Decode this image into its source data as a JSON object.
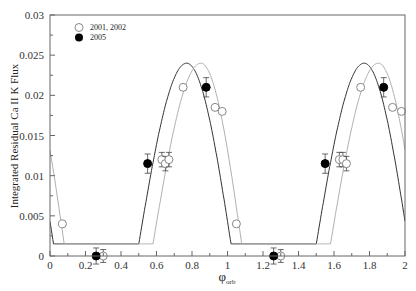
{
  "chart_data": {
    "type": "scatter",
    "title": "",
    "xlabel": "φ_orb",
    "xlabel_main": "φ",
    "xlabel_sub": "orb",
    "ylabel": "Integrated Residual Ca II K Flux",
    "xlim": [
      0,
      2
    ],
    "ylim": [
      0,
      0.03
    ],
    "x_ticks": [
      0,
      0.2,
      0.4,
      0.6,
      0.8,
      1,
      1.2,
      1.4,
      1.6,
      1.8,
      2
    ],
    "x_tick_labels": [
      "0",
      "0.2",
      "0.4",
      "0.6",
      "0.8",
      "1",
      "1.2",
      "1.4",
      "1.6",
      "1.8",
      "2"
    ],
    "y_ticks": [
      0,
      0.005,
      0.01,
      0.015,
      0.02,
      0.025,
      0.03
    ],
    "y_tick_labels": [
      "0",
      "0.005",
      "0.01",
      "0.015",
      "0.02",
      "0.025",
      "0.03"
    ],
    "grid": false,
    "legend_position": "upper left",
    "series": [
      {
        "name": "2001, 2002",
        "marker": "open-circle",
        "x": [
          0.07,
          0.3,
          0.63,
          0.65,
          0.67,
          0.75,
          0.93,
          0.97,
          1.05,
          1.3,
          1.63,
          1.65,
          1.67,
          1.75,
          1.93,
          1.98
        ],
        "y": [
          0.004,
          0.0,
          0.012,
          0.0115,
          0.012,
          0.021,
          0.0185,
          0.018,
          0.004,
          0.0,
          0.012,
          0.012,
          0.0115,
          0.021,
          0.0185,
          0.018
        ],
        "yerr": [
          0,
          0.0008,
          0.0009,
          0.0009,
          0.0009,
          0,
          0,
          0,
          0,
          0.0008,
          0.0009,
          0.0009,
          0.0009,
          0,
          0,
          0
        ]
      },
      {
        "name": "2005",
        "marker": "filled-circle",
        "x": [
          0.26,
          0.55,
          0.88,
          1.26,
          1.55,
          1.88
        ],
        "y": [
          0.0,
          0.0115,
          0.021,
          0.0,
          0.0115,
          0.021
        ],
        "yerr": [
          0.001,
          0.0012,
          0.0012,
          0.001,
          0.0012,
          0.0012
        ]
      }
    ],
    "model_curves": [
      {
        "name": "model (dark)",
        "color": "#333333",
        "floor": 0.0015,
        "peaks_at": [
          0.77,
          1.77
        ],
        "peak_value": 0.024,
        "rise_start": [
          0.5,
          1.5
        ],
        "fall_end": [
          1.02,
          2.02
        ]
      },
      {
        "name": "model (light)",
        "color": "#aaaaaa",
        "floor": 0.0015,
        "peaks_at": [
          0.85,
          1.85
        ],
        "peak_value": 0.024,
        "rise_start": [
          0.58,
          1.58
        ],
        "fall_end": [
          1.08,
          2.08
        ]
      }
    ]
  },
  "legend": {
    "items": [
      {
        "label": "2001, 2002",
        "marker": "open-circle"
      },
      {
        "label": "2005",
        "marker": "filled-circle"
      }
    ]
  },
  "colors": {
    "axis": "#555555",
    "dark_curve": "#333333",
    "light_curve": "#b0b0b0",
    "marker": "#000000",
    "open_marker": "#888888"
  }
}
